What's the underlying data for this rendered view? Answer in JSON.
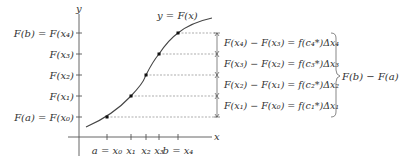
{
  "diagram": {
    "axes": {
      "y_label": "y",
      "x_label": "x"
    },
    "curve_label": "y = F(x)",
    "y_ticks": [
      {
        "label": "F(b) = F(x₄)",
        "y": 33
      },
      {
        "label": "F(x₃)",
        "y": 54
      },
      {
        "label": "F(x₂)",
        "y": 75
      },
      {
        "label": "F(x₁)",
        "y": 96
      },
      {
        "label": "F(a) = F(x₀)",
        "y": 117
      }
    ],
    "x_ticks": [
      {
        "label": "a = x₀",
        "x": 107
      },
      {
        "label": "x₁",
        "x": 131
      },
      {
        "label": "x₂",
        "x": 146
      },
      {
        "label": "x₃",
        "x": 159
      },
      {
        "label": "b = x₄",
        "x": 178
      }
    ],
    "equations": [
      "F(x₄) − F(x₃) = f(c₄*)Δx₄",
      "F(x₃) − F(x₂) = f(c₃*)Δx₃",
      "F(x₂) − F(x₁) = f(c₂*)Δx₂",
      "F(x₁) − F(x₀) = f(c₁*)Δx₁"
    ],
    "brace_label": "F(b) − F(a)"
  }
}
